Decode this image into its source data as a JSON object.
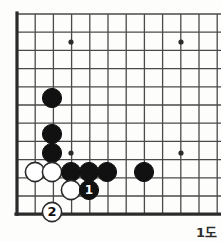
{
  "figure": {
    "kind": "go-board-diagram",
    "caption": "1도",
    "background_color": "#fdfdfc"
  },
  "board": {
    "line_color": "#4a4a4a",
    "edge_color": "#2b2b2b",
    "grid_spacing": 18.2,
    "origin_x": 17,
    "origin_y": 14,
    "cols": 12,
    "rows": 11,
    "edges": {
      "left": true,
      "bottom": true,
      "top": false,
      "right": false
    },
    "star_points": [
      {
        "x": 71,
        "y": 42
      },
      {
        "x": 181,
        "y": 42
      },
      {
        "x": 71,
        "y": 153
      },
      {
        "x": 181,
        "y": 153
      }
    ],
    "star_radius": 2.6
  },
  "stones": {
    "radius": 9.6,
    "black_color": "#111111",
    "white_color": "#ffffff",
    "white_outline": "#2b2b2b",
    "items": [
      {
        "color": "black",
        "x": 52,
        "y": 98,
        "label": "",
        "name": "black-stone"
      },
      {
        "color": "black",
        "x": 52,
        "y": 134,
        "label": "",
        "name": "black-stone"
      },
      {
        "color": "black",
        "x": 52,
        "y": 153,
        "label": "",
        "name": "black-stone"
      },
      {
        "color": "white",
        "x": 35,
        "y": 172,
        "label": "",
        "name": "white-stone"
      },
      {
        "color": "white",
        "x": 52,
        "y": 172,
        "label": "",
        "name": "white-stone"
      },
      {
        "color": "black",
        "x": 71,
        "y": 172,
        "label": "",
        "name": "black-stone"
      },
      {
        "color": "black",
        "x": 89,
        "y": 172,
        "label": "",
        "name": "black-stone"
      },
      {
        "color": "black",
        "x": 107,
        "y": 172,
        "label": "",
        "name": "black-stone"
      },
      {
        "color": "black",
        "x": 144,
        "y": 172,
        "label": "",
        "name": "black-stone"
      },
      {
        "color": "white",
        "x": 71,
        "y": 190,
        "label": "",
        "name": "white-stone"
      },
      {
        "color": "black",
        "x": 89,
        "y": 190,
        "label": "1",
        "name": "black-stone-move-1"
      },
      {
        "color": "white",
        "x": 52,
        "y": 212,
        "label": "2",
        "name": "white-stone-move-2"
      }
    ]
  },
  "moves": {
    "black_move_1": "1",
    "white_move_2": "2"
  }
}
